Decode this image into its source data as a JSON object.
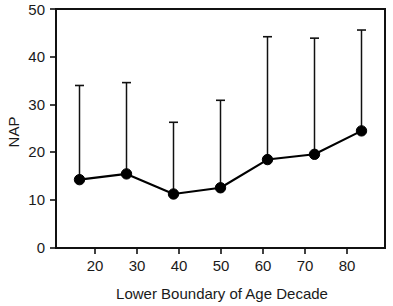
{
  "chart_data": {
    "type": "line",
    "title": "",
    "subtitle": "",
    "xlabel": "Lower Boundary of Age Decade",
    "ylabel": "NAP",
    "x": [
      20,
      30,
      40,
      50,
      60,
      70,
      80
    ],
    "values": [
      14.3,
      15.5,
      11.3,
      12.6,
      18.5,
      19.6,
      24.5
    ],
    "error_upper": [
      34.0,
      34.6,
      26.3,
      30.9,
      44.2,
      43.9,
      45.6
    ],
    "error_bar_style": "upper-only-with-cap",
    "xlim": [
      15,
      85
    ],
    "ylim": [
      0,
      50
    ],
    "xticks": [
      20,
      30,
      40,
      50,
      60,
      70,
      80
    ],
    "yticks": [
      0,
      10,
      20,
      30,
      40,
      50
    ],
    "xtick_labels": [
      "20",
      "30",
      "40",
      "50",
      "60",
      "70",
      "80"
    ],
    "ytick_labels": [
      "0",
      "10",
      "20",
      "30",
      "40",
      "50"
    ],
    "grid": false,
    "legend": false,
    "legend_position": "none",
    "marker": "filled-circle",
    "series": [
      {
        "name": "NAP",
        "values": [
          14.3,
          15.5,
          11.3,
          12.6,
          18.5,
          19.6,
          24.5
        ],
        "error_upper": [
          34.0,
          34.6,
          26.3,
          30.9,
          44.2,
          43.9,
          45.6
        ]
      }
    ],
    "colors": {
      "line": "#000000",
      "marker": "#000000",
      "errorbar": "#111111",
      "axis": "#111111",
      "background": "#ffffff"
    }
  }
}
